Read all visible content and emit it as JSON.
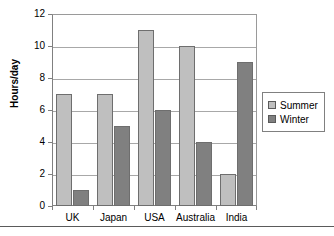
{
  "chart_data": {
    "type": "bar",
    "title": "",
    "subtitle": "",
    "xlabel": "",
    "ylabel": "Hours/day",
    "categories": [
      "UK",
      "Japan",
      "USA",
      "Australia",
      "India"
    ],
    "series": [
      {
        "name": "Summer",
        "values": [
          7,
          7,
          11,
          10,
          2
        ],
        "color": "#bfbfbf"
      },
      {
        "name": "Winter",
        "values": [
          1,
          5,
          6,
          4,
          9
        ],
        "color": "#808080"
      }
    ],
    "ylim": [
      0,
      12
    ],
    "ytick_labels": [
      "0",
      "2",
      "4",
      "6",
      "8",
      "10",
      "12"
    ],
    "ytick_values": [
      0,
      2,
      4,
      6,
      8,
      10,
      12
    ],
    "grid": true,
    "grid_axis": "y",
    "legend_position": "right",
    "orientation": "vertical",
    "grouping": "clustered"
  },
  "legend": {
    "entries": [
      {
        "label": "Summer",
        "swatch": "legend-swatch-summer"
      },
      {
        "label": "Winter",
        "swatch": "legend-swatch-winter"
      }
    ]
  },
  "colors": {
    "summer": "#bfbfbf",
    "winter": "#808080",
    "axis": "#808080",
    "grid": "#a8a8a8",
    "bar_outline": "#6e6e6e",
    "text": "#000000",
    "background": "#ffffff"
  }
}
